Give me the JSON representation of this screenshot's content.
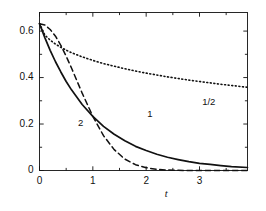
{
  "chart_data": {
    "type": "line",
    "title": "",
    "subtitle": "",
    "xlabel": "t",
    "ylabel": "",
    "xlim": [
      0,
      3.9
    ],
    "ylim": [
      0,
      0.68
    ],
    "grid": false,
    "legend": "inline-curve-labels",
    "x_ticks": [
      0,
      1,
      2,
      3
    ],
    "x_tick_labels": [
      "0",
      "1",
      "2",
      "3"
    ],
    "x_minor_ticks": [
      0.5,
      1.5,
      2.5,
      3.5
    ],
    "y_ticks": [
      0,
      0.2,
      0.4,
      0.6
    ],
    "y_tick_labels": [
      "0",
      "0.2",
      "0.4",
      "0.6"
    ],
    "y_minor_ticks": [
      0.1,
      0.3,
      0.5
    ],
    "y0": 0.632,
    "series": [
      {
        "name": "1/2",
        "label": "1/2",
        "style": "dotted",
        "color": "#111111",
        "label_x": 3.05,
        "label_y": 0.295,
        "x": [
          0,
          0.1,
          0.2,
          0.3,
          0.4,
          0.5,
          0.6,
          0.8,
          1.0,
          1.2,
          1.4,
          1.6,
          1.8,
          2.0,
          2.2,
          2.4,
          2.6,
          2.8,
          3.0,
          3.2,
          3.4,
          3.6,
          3.9
        ],
        "values": [
          0.632,
          0.583,
          0.561,
          0.544,
          0.53,
          0.518,
          0.507,
          0.489,
          0.474,
          0.46,
          0.449,
          0.438,
          0.428,
          0.419,
          0.411,
          0.403,
          0.396,
          0.389,
          0.383,
          0.377,
          0.371,
          0.366,
          0.358
        ]
      },
      {
        "name": "1",
        "label": "1",
        "style": "solid",
        "color": "#111111",
        "label_x": 2.02,
        "label_y": 0.245,
        "x": [
          0,
          0.1,
          0.2,
          0.3,
          0.4,
          0.5,
          0.6,
          0.8,
          1.0,
          1.2,
          1.4,
          1.6,
          1.8,
          2.0,
          2.2,
          2.4,
          2.6,
          2.8,
          3.0,
          3.2,
          3.4,
          3.6,
          3.9
        ],
        "values": [
          0.632,
          0.572,
          0.517,
          0.468,
          0.424,
          0.383,
          0.347,
          0.284,
          0.233,
          0.19,
          0.156,
          0.128,
          0.104,
          0.086,
          0.07,
          0.057,
          0.047,
          0.038,
          0.031,
          0.026,
          0.021,
          0.017,
          0.013
        ]
      },
      {
        "name": "2",
        "label": "2",
        "style": "dashed",
        "color": "#111111",
        "label_x": 0.72,
        "label_y": 0.205,
        "x": [
          0,
          0.1,
          0.2,
          0.3,
          0.4,
          0.5,
          0.6,
          0.8,
          1.0,
          1.2,
          1.4,
          1.6,
          1.8,
          2.0,
          2.2,
          2.4,
          2.6,
          2.8,
          3.0,
          3.2,
          3.4,
          3.6,
          3.9
        ],
        "values": [
          0.632,
          0.626,
          0.607,
          0.578,
          0.539,
          0.492,
          0.441,
          0.333,
          0.233,
          0.15,
          0.09,
          0.049,
          0.025,
          0.012,
          0.005,
          0.002,
          0.001,
          0.0,
          0.0,
          0.0,
          0.0,
          0.0,
          0.0
        ]
      }
    ],
    "curve_endpoints_readout": {
      "1/2": 0.25,
      "1": 0.1,
      "2": 0.02
    },
    "axis_color": "#111111",
    "background": "#ffffff"
  }
}
